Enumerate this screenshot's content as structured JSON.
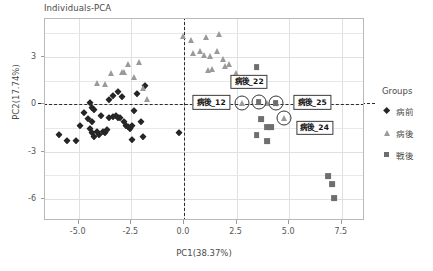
{
  "chart_data": {
    "type": "scatter",
    "title": "Individuals-PCA",
    "xlabel": "PC1(38.37%)",
    "ylabel": "PC2(17.74%)",
    "xlim": [
      -6.6,
      8.6
    ],
    "ylim": [
      -7.4,
      5.4
    ],
    "xticks": [
      "-5.0",
      "-2.5",
      "0.0",
      "2.5",
      "5.0",
      "7.5"
    ],
    "xtick_values": [
      -5.0,
      -2.5,
      0.0,
      2.5,
      5.0,
      7.5
    ],
    "yticks": [
      "3",
      "0",
      "-3",
      "-6"
    ],
    "ytick_values": [
      3,
      0,
      -3,
      -6
    ],
    "grid": true,
    "legend_position": "right",
    "reference_lines": {
      "x": 0,
      "y": 0,
      "style": "dashed"
    },
    "legend_title": "Groups",
    "series": [
      {
        "name": "病前",
        "marker": "diamond",
        "color": "#262626",
        "points": [
          [
            -5.95,
            -1.95
          ],
          [
            -5.55,
            -2.35
          ],
          [
            -5.15,
            -2.35
          ],
          [
            -4.95,
            -1.35
          ],
          [
            -4.75,
            -0.55
          ],
          [
            -4.55,
            -0.95
          ],
          [
            -4.45,
            -1.55
          ],
          [
            -4.35,
            -1.15
          ],
          [
            -4.35,
            -1.85
          ],
          [
            -4.25,
            -2.05
          ],
          [
            -4.15,
            -1.75
          ],
          [
            -4.05,
            -1.95
          ],
          [
            -4.45,
            0.05
          ],
          [
            -4.35,
            -0.25
          ],
          [
            -4.25,
            -0.35
          ],
          [
            -3.95,
            -0.75
          ],
          [
            -3.85,
            -1.75
          ],
          [
            -3.75,
            -1.85
          ],
          [
            -3.65,
            -1.65
          ],
          [
            -3.55,
            -0.85
          ],
          [
            -3.35,
            -0.8
          ],
          [
            -3.25,
            -0.75
          ],
          [
            -3.15,
            -0.85
          ],
          [
            -3.05,
            -0.85
          ],
          [
            -3.55,
            0.25
          ],
          [
            -3.35,
            0.55
          ],
          [
            -3.15,
            0.75
          ],
          [
            -2.95,
            0.45
          ],
          [
            -2.85,
            -1.15
          ],
          [
            -2.75,
            -1.35
          ],
          [
            -2.65,
            -1.45
          ],
          [
            -2.55,
            -1.55
          ],
          [
            -2.45,
            -1.35
          ],
          [
            -2.45,
            -2.25
          ],
          [
            -2.35,
            -0.45
          ],
          [
            -2.25,
            0.65
          ],
          [
            -2.05,
            -1.15
          ],
          [
            -1.95,
            -2.05
          ],
          [
            -1.85,
            1.15
          ],
          [
            -0.25,
            -1.85
          ]
        ]
      },
      {
        "name": "病後",
        "marker": "triangle",
        "color": "#9a9a9a",
        "points": [
          [
            -4.15,
            1.35
          ],
          [
            -3.45,
            1.95
          ],
          [
            -3.75,
            1.25
          ],
          [
            -2.95,
            2.05
          ],
          [
            -2.85,
            2.05
          ],
          [
            -2.65,
            2.55
          ],
          [
            -2.35,
            1.75
          ],
          [
            -2.15,
            2.65
          ],
          [
            -1.95,
            1.05
          ],
          [
            -1.75,
            0.35
          ],
          [
            -0.05,
            4.35
          ],
          [
            0.35,
            4.05
          ],
          [
            0.45,
            3.25
          ],
          [
            0.75,
            3.35
          ],
          [
            0.95,
            3.15
          ],
          [
            1.05,
            4.25
          ],
          [
            1.15,
            2.15
          ],
          [
            1.25,
            3.05
          ],
          [
            1.35,
            2.25
          ],
          [
            1.55,
            3.35
          ],
          [
            1.65,
            4.45
          ],
          [
            1.85,
            2.85
          ],
          [
            1.95,
            2.45
          ],
          [
            2.15,
            2.55
          ],
          [
            2.45,
            1.95
          ],
          [
            2.75,
            0.05
          ],
          [
            3.95,
            0.05
          ],
          [
            4.35,
            0.05
          ],
          [
            4.75,
            -0.85
          ]
        ]
      },
      {
        "name": "戦後",
        "marker": "square",
        "color": "#6e6e6e",
        "points": [
          [
            3.45,
            2.35
          ],
          [
            3.55,
            0.15
          ],
          [
            4.35,
            0.05
          ],
          [
            3.65,
            -0.95
          ],
          [
            3.95,
            -1.45
          ],
          [
            4.15,
            -1.45
          ],
          [
            3.45,
            -1.95
          ],
          [
            3.95,
            -2.35
          ],
          [
            6.85,
            -4.55
          ],
          [
            7.05,
            -5.05
          ],
          [
            7.15,
            -5.95
          ]
        ]
      }
    ],
    "annotations": [
      {
        "label": "病後_12",
        "x": 1.35,
        "y": 0.05,
        "target_x": 2.75,
        "target_y": 0.05,
        "circled": true
      },
      {
        "label": "病後_22",
        "x": 3.15,
        "y": 1.35,
        "target_x": 3.55,
        "target_y": 0.15,
        "circled": true
      },
      {
        "label": "病後_25",
        "x": 6.15,
        "y": 0.05,
        "target_x": 4.35,
        "target_y": 0.05,
        "circled": true
      },
      {
        "label": "病後_24",
        "x": 6.25,
        "y": -1.55,
        "target_x": 4.75,
        "target_y": -0.85,
        "circled": true
      }
    ]
  }
}
